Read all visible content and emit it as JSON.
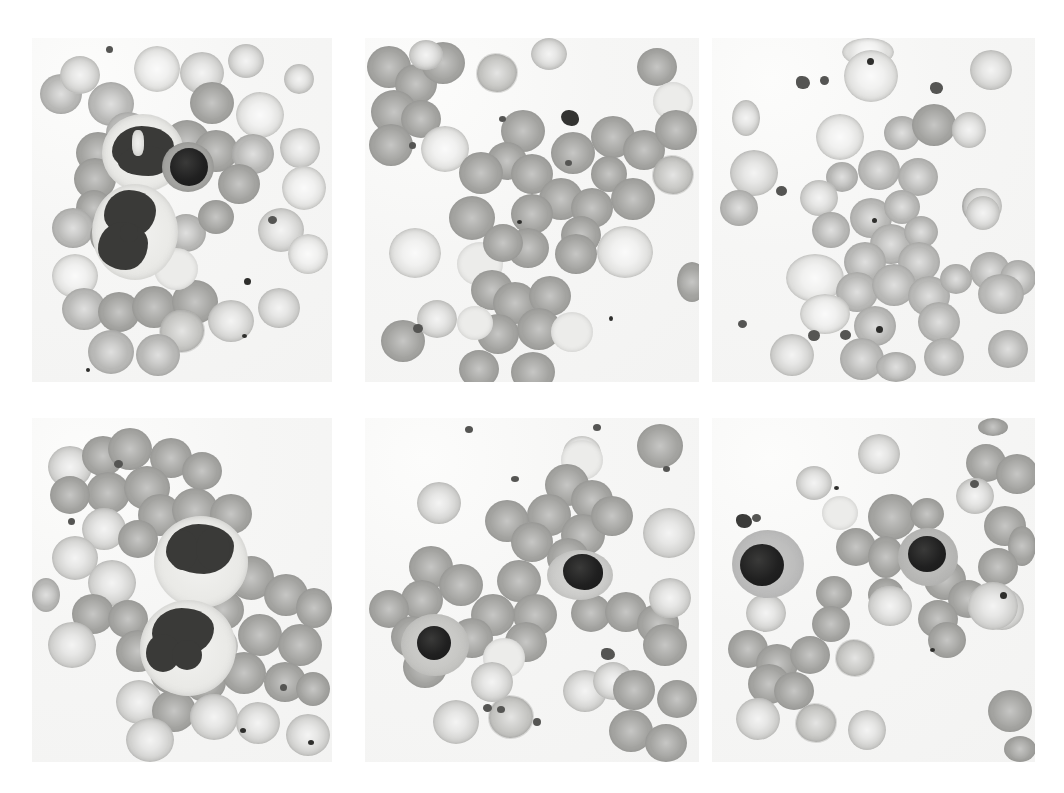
{
  "figure": {
    "kind": "photomicrograph-grid",
    "modality": "light microscopy, Wright-Giemsa stained peripheral blood smear",
    "rows": 2,
    "columns": 3,
    "background_color": "#ffffff",
    "field_color": "#f5f5f3"
  },
  "palette": {
    "background": "#ffffff",
    "smear_field": "#f5f5f3",
    "erythrocyte_mid": "#b9b9b7",
    "erythrocyte_dark": "#a4a4a1",
    "erythrocyte_light": "#d3d3d1",
    "erythrocyte_pale": "#e0e0de",
    "nucleus_dark": "#3a3a38",
    "lymphocyte_nucleus": "#1a1a1a",
    "cytoplasm": "#eaeae7",
    "platelet": "#555553"
  },
  "panels": [
    {
      "id": "panel-1",
      "position": "top-left",
      "label": "",
      "description": "Two segmented neutrophils with lobulated dark nuclei and granular pale cytoplasm, plus one small dark lymphocyte, surrounded by numerous erythrocytes",
      "cells_visible": {
        "neutrophils": 2,
        "lymphocytes": 1,
        "erythrocytes": 34,
        "platelets": 3
      }
    },
    {
      "id": "panel-2",
      "position": "top-middle",
      "label": "",
      "description": "Field of erythrocytes with overlapping clusters, one dark platelet clump near upper centre and scattered platelets",
      "cells_visible": {
        "neutrophils": 0,
        "lymphocytes": 0,
        "erythrocytes": 44,
        "platelets": 5
      }
    },
    {
      "id": "panel-3",
      "position": "top-right",
      "label": "",
      "description": "Erythrocytes of varying size with small dark punctate inclusions and several platelet clumps; no nucleated white cells in field",
      "cells_visible": {
        "neutrophils": 0,
        "lymphocytes": 0,
        "erythrocytes": 40,
        "platelets": 7
      }
    },
    {
      "id": "panel-4",
      "position": "bottom-left",
      "label": "",
      "description": "Two neutrophils with densely lobed, coarsely clumped dark nuclei and pale vacuolated cytoplasm amid erythrocytes",
      "cells_visible": {
        "neutrophils": 2,
        "lymphocytes": 0,
        "erythrocytes": 38,
        "platelets": 3
      }
    },
    {
      "id": "panel-5",
      "position": "bottom-middle",
      "label": "",
      "description": "Two small mature lymphocytes with condensed round black nuclei and scant cytoplasm among erythrocytes",
      "cells_visible": {
        "neutrophils": 0,
        "lymphocytes": 2,
        "erythrocytes": 36,
        "platelets": 4
      }
    },
    {
      "id": "panel-6",
      "position": "bottom-right",
      "label": "",
      "description": "Two small lymphocytes with round dark nuclei and thin grey cytoplasmic rims, one platelet clump at upper left, erythrocytes throughout",
      "cells_visible": {
        "neutrophils": 0,
        "lymphocytes": 2,
        "erythrocytes": 32,
        "platelets": 3
      }
    }
  ],
  "caption": {
    "visible": "partially-cropped",
    "text": ""
  }
}
